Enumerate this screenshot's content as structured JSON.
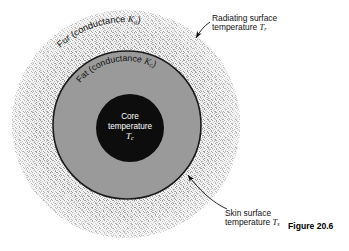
{
  "figure": {
    "caption": "Figure 20.6",
    "background": "#ffffff",
    "layers": [
      {
        "name": "fur",
        "label_prefix": "Fur (conductance ",
        "symbol": "K",
        "symbol_sub": "a",
        "label_suffix": ")",
        "fill": "#e3e3e3",
        "texture": "stipple",
        "cx": 126,
        "cy": 124,
        "r": 114
      },
      {
        "name": "fat",
        "label_prefix": "Fat (conductance ",
        "symbol": "K",
        "symbol_sub": "c",
        "label_suffix": ")",
        "fill": "#999999",
        "texture": "solid",
        "cx": 127,
        "cy": 125,
        "r": 74
      },
      {
        "name": "core",
        "label_line1": "Core",
        "label_line2": "temperature",
        "symbol": "T",
        "symbol_sub": "c",
        "fill": "#0d0d0d",
        "texture": "solid",
        "cx": 130,
        "cy": 128,
        "r": 34
      }
    ],
    "callouts": [
      {
        "name": "radiating-surface",
        "line1": "Radiating surface",
        "line2_prefix": "temperature ",
        "line2_symbol": "T",
        "line2_sub": "r"
      },
      {
        "name": "skin-surface",
        "line1": "Skin surface",
        "line2_prefix": "temperature ",
        "line2_symbol": "T",
        "line2_sub": "s"
      }
    ]
  }
}
